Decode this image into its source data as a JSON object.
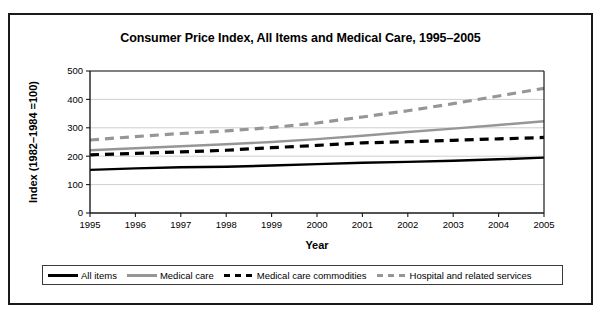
{
  "figure": {
    "title": "Consumer Price Index, All Items and Medical Care, 1995–2005",
    "xlabel": "Year",
    "ylabel": "Index (1982–1984 =100)"
  },
  "legend": {
    "items": [
      {
        "label": "All items",
        "style": "solid",
        "color": "#000000"
      },
      {
        "label": "Medical care",
        "style": "solid",
        "color": "#969696"
      },
      {
        "label": "Medical care commodities",
        "style": "dashed",
        "color": "#000000"
      },
      {
        "label": "Hospital and related services",
        "style": "dashed",
        "color": "#969696"
      }
    ]
  },
  "chart_data": {
    "type": "line",
    "title": "Consumer Price Index, All Items and Medical Care, 1995–2005",
    "xlabel": "Year",
    "ylabel": "Index (1982–1984 =100)",
    "x": [
      1995,
      1996,
      1997,
      1998,
      1999,
      2000,
      2001,
      2002,
      2003,
      2004,
      2005
    ],
    "categories": [
      "1995",
      "1996",
      "1997",
      "1998",
      "1999",
      "2000",
      "2001",
      "2002",
      "2003",
      "2004",
      "2005"
    ],
    "xlim": [
      1995,
      2005
    ],
    "ylim": [
      0,
      500
    ],
    "yticks": [
      0,
      100,
      200,
      300,
      400,
      500
    ],
    "grid": "horizontal",
    "legend_position": "bottom",
    "series": [
      {
        "name": "All items",
        "color": "#000000",
        "style": "solid",
        "values": [
          152,
          157,
          161,
          163,
          167,
          172,
          177,
          180,
          184,
          189,
          195
        ]
      },
      {
        "name": "Medical care",
        "color": "#969696",
        "style": "solid",
        "values": [
          221,
          228,
          235,
          242,
          250,
          260,
          272,
          285,
          297,
          310,
          323
        ]
      },
      {
        "name": "Medical care commodities",
        "color": "#000000",
        "style": "dashed",
        "values": [
          205,
          210,
          215,
          221,
          230,
          238,
          247,
          251,
          256,
          261,
          266
        ]
      },
      {
        "name": "Hospital and related services",
        "color": "#969696",
        "style": "dashed",
        "values": [
          257,
          269,
          280,
          289,
          301,
          317,
          338,
          360,
          385,
          412,
          439
        ]
      }
    ]
  }
}
